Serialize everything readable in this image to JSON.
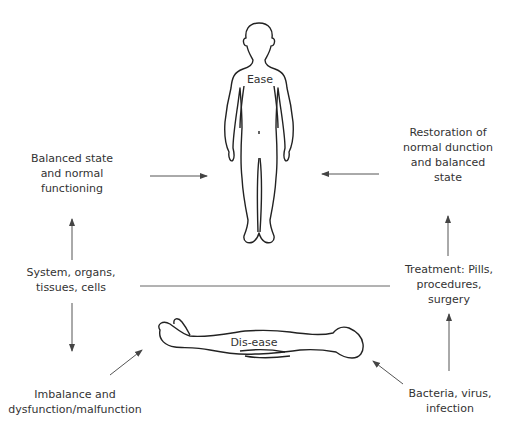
{
  "figures": {
    "standing": {
      "label": "Ease"
    },
    "lying": {
      "label": "Dis-ease"
    }
  },
  "nodes": {
    "balanced_state": {
      "lines": [
        "Balanced state",
        "and normal",
        "functioning"
      ]
    },
    "restoration": {
      "lines": [
        "Restoration of",
        "normal dunction",
        "and balanced",
        "state"
      ]
    },
    "system": {
      "lines": [
        "System, organs,",
        "tissues, cells"
      ]
    },
    "treatment": {
      "lines": [
        "Treatment: Pills,",
        "procedures,",
        "surgery"
      ]
    },
    "imbalance": {
      "lines": [
        "Imbalance and",
        "dysfunction/malfunction"
      ]
    },
    "bacteria": {
      "lines": [
        "Bacteria, virus,",
        "infection"
      ]
    }
  },
  "arrows": [
    {
      "from": "balanced_state",
      "to": "standing_figure",
      "direction": "right"
    },
    {
      "from": "restoration",
      "to": "standing_figure",
      "direction": "left"
    },
    {
      "from": "system",
      "to": "balanced_state",
      "direction": "up"
    },
    {
      "from": "system",
      "to": "imbalance",
      "direction": "down"
    },
    {
      "from": "treatment",
      "to": "restoration",
      "direction": "up"
    },
    {
      "from": "bacteria",
      "to": "treatment",
      "direction": "up"
    },
    {
      "from": "imbalance",
      "to": "lying_figure",
      "direction": "up-right"
    },
    {
      "from": "bacteria",
      "to": "lying_figure",
      "direction": "up-left"
    },
    {
      "from": "system",
      "to": "treatment",
      "direction": "none"
    }
  ],
  "colors": {
    "stroke": "#333333",
    "text": "#333333",
    "arrow": "#555555",
    "background": "#ffffff"
  }
}
